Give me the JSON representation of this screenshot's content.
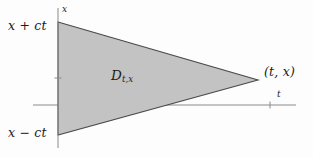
{
  "figure": {
    "type": "math-diagram",
    "width": 313,
    "height": 157,
    "background_color": "#fdfdfd"
  },
  "axes": {
    "vertical": {
      "label": "x",
      "axis_color": "#8a8a8a",
      "x_position": 58,
      "y_top": 8,
      "y_bottom": 148,
      "tick": {
        "y": 78
      }
    },
    "horizontal": {
      "label": "t",
      "axis_color": "#8a8a8a",
      "y_position": 105,
      "x_left": 33,
      "x_right": 296,
      "tick": {
        "x": 270
      }
    }
  },
  "region": {
    "label_symbol": "D",
    "label_subscript": "t,x",
    "fill_color": "#c3c3c3",
    "stroke_color": "#4a4a4a",
    "vertices": {
      "top": {
        "x": 58,
        "y": 22
      },
      "bottom": {
        "x": 58,
        "y": 135
      },
      "apex": {
        "x": 258,
        "y": 80
      }
    }
  },
  "labels": {
    "top_left": "x + ct",
    "bottom_left": "x − ct",
    "vertex": "(t, x)",
    "axis_x": "x",
    "axis_t": "t"
  }
}
